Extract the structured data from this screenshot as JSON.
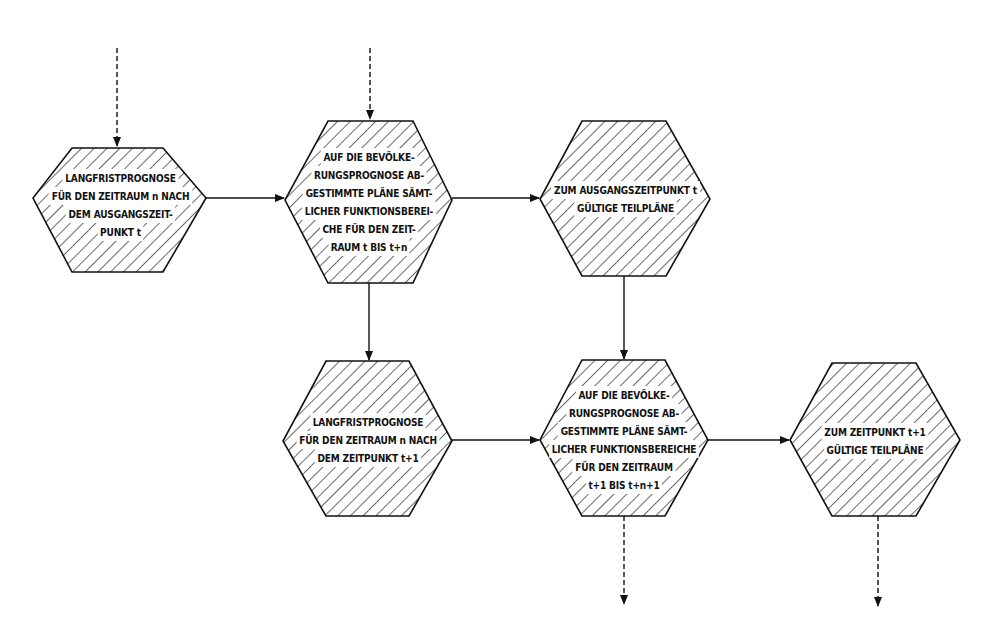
{
  "diagram": {
    "type": "flowchart",
    "style": {
      "ink_color": "#111111",
      "background": "#ffffff",
      "fill_pattern": "diagonal-hatch"
    },
    "nodes": [
      {
        "id": "n1",
        "shape": "hexagon",
        "lines": [
          "LANGFRISTPROGNOSE",
          "FÜR DEN ZEITRAUM n NACH",
          "DEM AUSGANGSZEIT-",
          "PUNKT  t"
        ]
      },
      {
        "id": "n2",
        "shape": "hexagon",
        "lines": [
          "AUF DIE BEVÖLKE-",
          "RUNGSPROGNOSE AB-",
          "GESTIMMTE PLÄNE SÄMT-",
          "LICHER FUNKTIONSBEREI-",
          "CHE FÜR DEN ZEIT-",
          "RAUM t BIS t+n"
        ]
      },
      {
        "id": "n3",
        "shape": "hexagon",
        "lines": [
          "ZUM AUSGANGSZEITPUNKT t",
          "GÜLTIGE  TEILPLÄNE"
        ]
      },
      {
        "id": "n4",
        "shape": "hexagon",
        "lines": [
          "LANGFRISTPROGNOSE",
          "FÜR DEN ZEITRAUM n NACH",
          "DEM ZEITPUNKT t+1"
        ]
      },
      {
        "id": "n5",
        "shape": "hexagon",
        "lines": [
          "AUF DIE BEVÖLKE-",
          "RUNGSPROGNOSE AB-",
          "GESTIMMTE PLÄNE SÄMT-",
          "LICHER FUNKTIONSBEREICHE",
          "FÜR DEN ZEITRAUM",
          "t+1 BIS t+n+1"
        ]
      },
      {
        "id": "n6",
        "shape": "hexagon",
        "lines": [
          "ZUM ZEITPUNKT t+1",
          "GÜLTIGE TEILPLÄNE"
        ]
      }
    ],
    "edges": [
      {
        "from": "external",
        "to": "n1",
        "style": "dashed"
      },
      {
        "from": "external",
        "to": "n2",
        "style": "dashed"
      },
      {
        "from": "n1",
        "to": "n2",
        "style": "solid"
      },
      {
        "from": "n2",
        "to": "n3",
        "style": "solid"
      },
      {
        "from": "n2",
        "to": "n4",
        "style": "solid"
      },
      {
        "from": "n3",
        "to": "n5",
        "style": "solid"
      },
      {
        "from": "n4",
        "to": "n5",
        "style": "solid"
      },
      {
        "from": "n5",
        "to": "n6",
        "style": "solid"
      },
      {
        "from": "n5",
        "to": "external",
        "style": "dashed"
      },
      {
        "from": "n6",
        "to": "external",
        "style": "dashed"
      }
    ]
  }
}
